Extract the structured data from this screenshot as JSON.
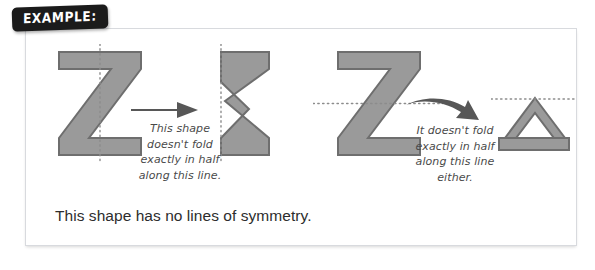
{
  "badge": {
    "label": "EXAMPLE:",
    "bg_color": "#1b1b1b",
    "text_color": "#ffffff"
  },
  "box": {
    "border_color": "#d8dade",
    "background": "#ffffff"
  },
  "figure": {
    "shape_fill": "#9a9a9a",
    "shape_stroke": "#6e6e6e",
    "fold_line_color": "#8c8c8c",
    "arrow_color": "#555555",
    "panels": [
      {
        "name": "vertical-fold-test",
        "original_shape": "letter-Z",
        "fold_line": "vertical",
        "arrow": "straight-right-arrow",
        "result_shape": "folded-Z-vertical",
        "caption": "This shape\ndoesn't fold\nexactly in half\nalong this line."
      },
      {
        "name": "horizontal-fold-test",
        "original_shape": "letter-Z",
        "fold_line": "horizontal",
        "arrow": "curved-right-arrow",
        "result_shape": "folded-Z-horizontal-triangle",
        "caption": "It doesn't fold\nexactly in half\nalong this line\neither."
      }
    ]
  },
  "conclusion": {
    "text": "This shape has no lines of symmetry."
  }
}
